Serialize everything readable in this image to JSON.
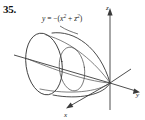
{
  "figure": {
    "problem_number": "35.",
    "equation": {
      "lhs": "y",
      "equals": " = ",
      "sign": "−(",
      "term1_base": "x",
      "term1_exp": "2",
      "plus": " + ",
      "term2_base": "z",
      "term2_exp": "2",
      "close": ")",
      "full_text": "y = −(x² + z²)"
    },
    "axes": {
      "z_label": "z",
      "y_label": "y",
      "x_label": "x"
    },
    "colors": {
      "background": "#ffffff",
      "stroke": "#2b2b2b",
      "axis": "#3a3a3a",
      "text": "#111111"
    }
  }
}
